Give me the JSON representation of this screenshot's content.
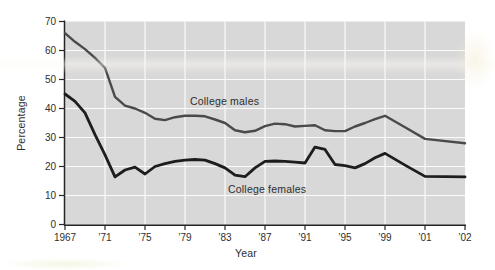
{
  "chart_data": {
    "type": "line",
    "title": "",
    "xlabel": "Year",
    "ylabel": "Percentage",
    "ylim": [
      0,
      70
    ],
    "y_ticks": [
      0,
      10,
      20,
      30,
      40,
      50,
      60,
      70
    ],
    "x_tick_labels": [
      "1967",
      "’71",
      "’75",
      "’79",
      "’83",
      "’87",
      "’91",
      "’95",
      "’99",
      "’01",
      "’02"
    ],
    "x_tick_years": [
      1967,
      1971,
      1975,
      1979,
      1983,
      1987,
      1991,
      1995,
      1999,
      2001,
      2002
    ],
    "grid": true,
    "legend_position": "inline-labels",
    "years": [
      1967,
      1968,
      1969,
      1970,
      1971,
      1972,
      1973,
      1974,
      1975,
      1976,
      1977,
      1978,
      1979,
      1980,
      1981,
      1982,
      1983,
      1984,
      1985,
      1986,
      1987,
      1988,
      1989,
      1990,
      1991,
      1992,
      1993,
      1994,
      1995,
      1996,
      1997,
      1998,
      1999,
      2000,
      2001,
      2002
    ],
    "series": [
      {
        "name": "College males",
        "color": "#4a4a4a",
        "line_width": 2.4,
        "values": [
          66,
          63,
          60.5,
          57.5,
          54,
          44,
          41,
          40,
          38.5,
          36.5,
          36,
          37,
          37.5,
          37.5,
          37.3,
          36.2,
          35,
          32.5,
          31.8,
          32.3,
          33.9,
          34.8,
          34.6,
          33.8,
          34,
          34.2,
          32.5,
          32.2,
          32.2,
          33.8,
          35,
          36.3,
          37.5,
          33.5,
          29.5,
          28
        ]
      },
      {
        "name": "College females",
        "color": "#1d1d1d",
        "line_width": 2.8,
        "values": [
          45,
          42.5,
          38.5,
          31,
          24,
          16.4,
          18.8,
          19.8,
          17.4,
          20,
          21,
          21.8,
          22.2,
          22.4,
          22.2,
          21,
          19.5,
          17,
          16.5,
          19.5,
          21.8,
          21.9,
          21.8,
          21.5,
          21.2,
          26.7,
          25.9,
          20.7,
          20.3,
          19.5,
          21,
          23,
          24.5,
          20.5,
          16.6,
          16.4
        ]
      }
    ],
    "colors": {
      "plot_background": "#d8d8d8",
      "gridline": "#fbfbfb",
      "axis": "#262626",
      "tick_text": "#2e2e2e"
    }
  }
}
